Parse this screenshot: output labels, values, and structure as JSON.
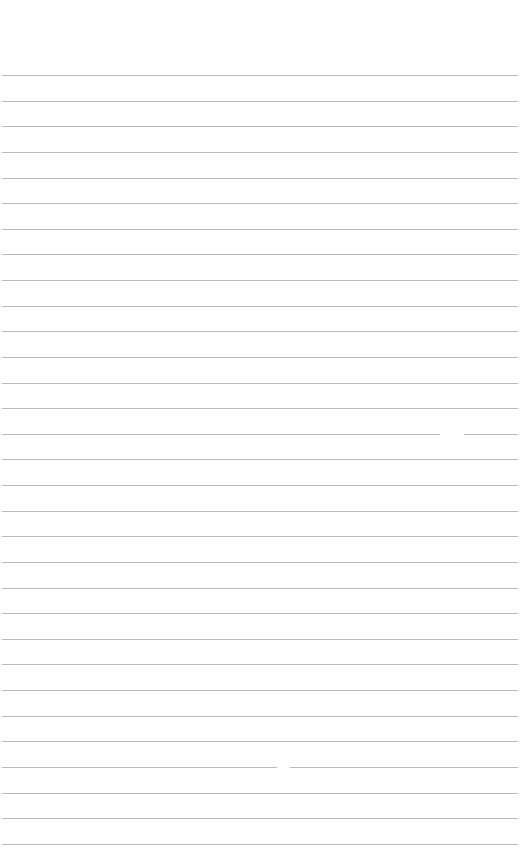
{
  "page": {
    "type": "lined-paper",
    "background_color": "#ffffff",
    "rule_color": "#b9b9b9",
    "first_rule_y": 75,
    "rule_spacing": 25.63,
    "rule_count": 31,
    "rule_left": 2,
    "rule_width": 516,
    "gaps": [
      {
        "line_index": 14,
        "x": 440,
        "width": 24
      },
      {
        "line_index": 27,
        "x": 277,
        "width": 13
      }
    ]
  }
}
